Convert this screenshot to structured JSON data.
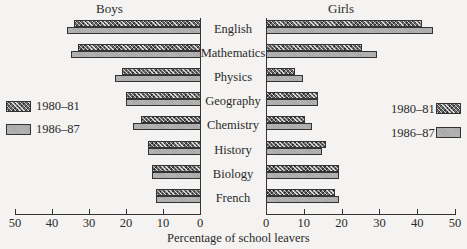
{
  "chart_data": {
    "type": "bar",
    "orientation": "horizontal",
    "layout": "back-to-back (butterfly)",
    "panels": [
      {
        "name": "Boys",
        "direction": "left"
      },
      {
        "name": "Girls",
        "direction": "right"
      }
    ],
    "categories": [
      "English",
      "Mathematics",
      "Physics",
      "Geography",
      "Chemistry",
      "History",
      "Biology",
      "French"
    ],
    "series": [
      {
        "name": "1980–81",
        "pattern": "cross-hatched",
        "boys": [
          34,
          33,
          21,
          20,
          16,
          14,
          13,
          12
        ],
        "girls": [
          41,
          25,
          7.5,
          13.5,
          10,
          15.5,
          19,
          18
        ]
      },
      {
        "name": "1986–87",
        "pattern": "light grey",
        "boys": [
          36,
          35,
          23,
          20,
          18,
          14,
          13,
          12
        ],
        "girls": [
          44,
          29,
          9.5,
          13.5,
          12,
          14.5,
          19,
          19
        ]
      }
    ],
    "title": "",
    "xlabel": "Percentage of school leavers",
    "ylabel": "",
    "xlim": [
      0,
      50
    ],
    "xticks": [
      50,
      40,
      30,
      20,
      10,
      0
    ],
    "xticks_right": [
      0,
      10,
      20,
      30,
      40,
      50
    ],
    "grid": false,
    "legend": {
      "entries": [
        "1980–81",
        "1986–87"
      ],
      "position": "both sides, mid-left and mid-right"
    }
  },
  "titles": {
    "boys": "Boys",
    "girls": "Girls"
  },
  "legend": {
    "a": "1980–81",
    "b": "1986–87"
  },
  "xlabel": "Percentage of school leavers"
}
